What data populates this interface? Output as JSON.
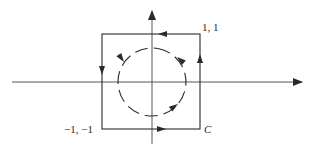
{
  "diagram": {
    "type": "contour-integration",
    "labels": {
      "top_right_corner": "1, 1",
      "bottom_left_corner": "−1, −1",
      "contour_name": "C"
    },
    "colors": {
      "stroke": "#2a2a2a",
      "background": "#ffffff"
    },
    "geometry": {
      "origin": [
        152,
        82
      ],
      "x_axis": {
        "x1": 12,
        "x2": 303,
        "y": 82
      },
      "y_axis": {
        "x": 152,
        "y1": 144,
        "y2": 10
      },
      "square": {
        "left": 102,
        "top": 34,
        "right": 200,
        "bottom": 129
      },
      "circle": {
        "cx": 152,
        "cy": 82,
        "r": 34
      }
    },
    "square_arrows": [
      {
        "edge": "top",
        "direction": "left"
      },
      {
        "edge": "left",
        "direction": "down"
      },
      {
        "edge": "bottom",
        "direction": "right"
      },
      {
        "edge": "right",
        "direction": "up"
      }
    ],
    "circle_arrows": [
      {
        "position": "upper-left",
        "direction": "counter-clockwise"
      },
      {
        "position": "upper-right",
        "direction": "counter-clockwise"
      },
      {
        "position": "lower-right",
        "direction": "counter-clockwise"
      }
    ]
  }
}
